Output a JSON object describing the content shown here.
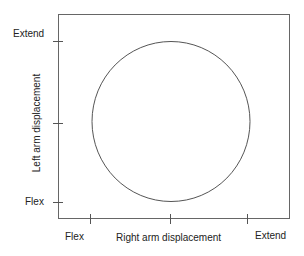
{
  "diagram": {
    "x_axis": {
      "label": "Right arm displacement",
      "ticks": [
        "Flex",
        "Extend"
      ]
    },
    "y_axis": {
      "label": "Left arm displacement",
      "ticks": [
        "Extend",
        "Flex"
      ]
    },
    "shape": "circle",
    "colors": {
      "line": "#555555",
      "text": "#222222"
    }
  }
}
